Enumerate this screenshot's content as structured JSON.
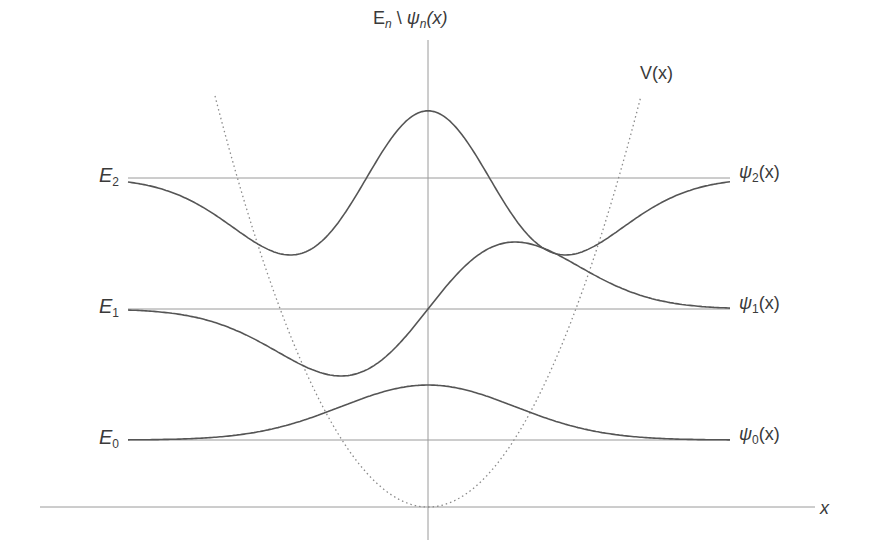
{
  "figure": {
    "axis_vertical": {
      "E": "E",
      "n": "n",
      "sep": " \\ ",
      "psi": "ψ",
      "n2": "n",
      "arg": "(x)"
    },
    "axis_horizontal": {
      "label": "x"
    },
    "potential": {
      "label": "V(x)"
    },
    "levels": [
      {
        "name": "E",
        "sub": "2",
        "psi_label": "ψ",
        "psi_sub": "2",
        "psi_arg": "(x)",
        "y": 178,
        "n": 2
      },
      {
        "name": "E",
        "sub": "1",
        "psi_label": "ψ",
        "psi_sub": "1",
        "psi_arg": "(x)",
        "y": 309,
        "n": 1
      },
      {
        "name": "E",
        "sub": "0",
        "psi_label": "ψ",
        "psi_sub": "0",
        "psi_arg": "(x)",
        "y": 440,
        "n": 0
      }
    ],
    "colors": {
      "curve": "#555555",
      "level_line": "#9a9a9a",
      "axis": "#9a9a9a",
      "potential": "#8a8a8a",
      "text": "#3a3a3a"
    },
    "geometry": {
      "origin_x": 428,
      "axis_y": 507,
      "axis_top": 40,
      "axis_bottom": 540,
      "x_axis_left": 40,
      "x_axis_right": 815,
      "level_left": 128,
      "level_right": 730,
      "px_per_unit": 87,
      "potential_top_y": 96,
      "potential_half_width": 213,
      "amplitudes": [
        55,
        67,
        77
      ]
    }
  },
  "chart_data": {
    "type": "line",
    "xlabel": "x",
    "ylabel": "En \\ ψn(x)",
    "series": [
      {
        "name": "V(x)",
        "style": "dotted",
        "shape": "parabola, vertex at origin"
      },
      {
        "name": "E0",
        "style": "solid horizontal",
        "level": 0.5
      },
      {
        "name": "E1",
        "style": "solid horizontal",
        "level": 1.5
      },
      {
        "name": "E2",
        "style": "solid horizontal",
        "level": 2.5
      },
      {
        "name": "ψ0(x)",
        "baseline": "E0",
        "shape": "Gaussian, single peak at x=0"
      },
      {
        "name": "ψ1(x)",
        "baseline": "E1",
        "shape": "odd, minimum at x<0, maximum at x>0, zero at x=0"
      },
      {
        "name": "ψ2(x)",
        "baseline": "E2",
        "shape": "even, two peaks, minimum at x=0, two nodes"
      }
    ],
    "legend": "inline labels at right end of each curve",
    "grid": false
  }
}
